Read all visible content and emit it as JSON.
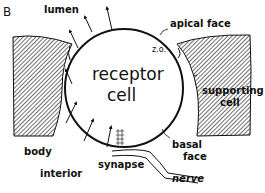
{
  "panel_letter": "B",
  "labels": {
    "lumen": "lumen",
    "apical_face": "apical face",
    "zo": "z.o.",
    "receptor_line1": "receptor",
    "receptor_line2": "cell",
    "supporting_line1": "supporting",
    "supporting_line2": "cell",
    "body": "body",
    "interior": "interior",
    "synapse": "synapse",
    "basal_line1": "basal",
    "basal_line2": "face",
    "nerve": "nerve"
  },
  "colors": {
    "ink": "#111111",
    "background": "#ffffff",
    "hatch": "#333333"
  }
}
